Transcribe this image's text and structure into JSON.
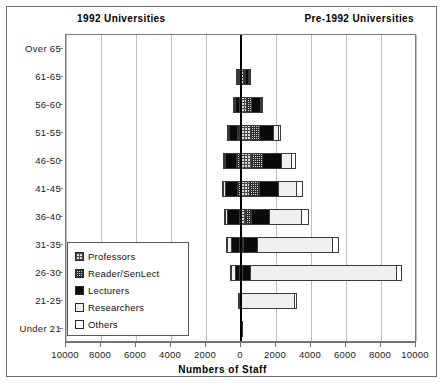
{
  "headers": {
    "left": "1992 Universities",
    "right": "Pre-1992 Universities"
  },
  "legend": {
    "items": [
      {
        "label": "Professors",
        "key": "professors",
        "swatch": "professors-swatch"
      },
      {
        "label": "Reader/SenLect",
        "key": "reader",
        "swatch": "reader-swatch"
      },
      {
        "label": "Lecturers",
        "key": "lecturers",
        "swatch": "lecturers-swatch"
      },
      {
        "label": "Researchers",
        "key": "researchers",
        "swatch": "researchers-swatch"
      },
      {
        "label": "Others",
        "key": "others",
        "swatch": "others-swatch"
      }
    ]
  },
  "axes": {
    "xlabel": "Numbers of Staff",
    "xticks": [
      10000,
      8000,
      6000,
      4000,
      2000,
      0,
      2000,
      4000,
      6000,
      8000,
      10000
    ],
    "xtick_labels": [
      "10000",
      "8000",
      "6000",
      "4000",
      "2000",
      "0",
      "2000",
      "4000",
      "6000",
      "8000",
      "10000"
    ],
    "xmax": 10000,
    "xstep": 2000,
    "ylabel": ""
  },
  "chart_data": {
    "type": "bar",
    "subtype": "population-pyramid-stacked",
    "title": "",
    "xlabel": "Numbers of Staff",
    "ylabel": "",
    "xlim": [
      -10000,
      10000
    ],
    "grid": true,
    "legend_position": "inside-lower-left",
    "left_panel": "1992 Universities",
    "right_panel": "Pre-1992 Universities",
    "categories": [
      "Over 65",
      "61-65",
      "56-60",
      "51-55",
      "46-50",
      "41-45",
      "36-40",
      "31-35",
      "26-30",
      "21-25",
      "Under 21"
    ],
    "series": [
      {
        "name": "Professors",
        "left": [
          10,
          60,
          110,
          170,
          180,
          140,
          90,
          40,
          10,
          0,
          0
        ],
        "right": [
          20,
          230,
          420,
          620,
          700,
          560,
          330,
          120,
          20,
          0,
          0
        ]
      },
      {
        "name": "Reader/SenLect",
        "left": [
          5,
          50,
          110,
          190,
          230,
          200,
          130,
          50,
          10,
          0,
          0
        ],
        "right": [
          10,
          150,
          330,
          560,
          690,
          620,
          400,
          150,
          30,
          0,
          0
        ]
      },
      {
        "name": "Lecturers",
        "left": [
          10,
          130,
          300,
          520,
          700,
          760,
          700,
          540,
          260,
          40,
          0
        ],
        "right": [
          15,
          260,
          560,
          880,
          1130,
          1180,
          1100,
          900,
          520,
          100,
          0
        ]
      },
      {
        "name": "Researchers",
        "left": [
          0,
          15,
          30,
          60,
          100,
          140,
          200,
          280,
          330,
          120,
          5
        ],
        "right": [
          5,
          60,
          140,
          320,
          620,
          1050,
          1900,
          4300,
          8400,
          3100,
          120
        ]
      },
      {
        "name": "Others",
        "left": [
          0,
          10,
          20,
          40,
          60,
          70,
          80,
          90,
          70,
          30,
          5
        ],
        "right": [
          5,
          40,
          90,
          180,
          300,
          400,
          430,
          430,
          330,
          160,
          20
        ]
      }
    ],
    "totals_left": [
      25,
      265,
      570,
      980,
      1270,
      1310,
      1200,
      1000,
      680,
      190,
      10
    ],
    "totals_right": [
      55,
      740,
      1540,
      2560,
      3440,
      3810,
      4160,
      5900,
      9300,
      3360,
      140
    ]
  },
  "palette": {
    "professors": "#d9d9d9",
    "reader": "#cfcfcf",
    "lecturers": "#0a0a0a",
    "researchers": "#efefef",
    "others": "#ffffff",
    "gridline": "#bdbdbd",
    "axis": "#6e6e6e",
    "text": "#111111"
  }
}
